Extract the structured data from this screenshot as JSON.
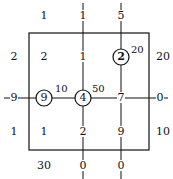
{
  "diagram": {
    "type": "transportation-grid",
    "top_row": [
      "1",
      "1",
      "5"
    ],
    "left_col": [
      "2",
      "9",
      "1"
    ],
    "right_col": [
      "20",
      "0",
      "10"
    ],
    "bottom_row": [
      "30",
      "0",
      "0"
    ],
    "cells": {
      "r1": [
        "2",
        "1",
        "2"
      ],
      "r2": [
        "9",
        "4",
        "7"
      ],
      "r3": [
        "1",
        "2",
        "9"
      ]
    },
    "circled": [
      {
        "value": "2",
        "label": "20"
      },
      {
        "value": "9",
        "label": "10"
      },
      {
        "value": "4",
        "label": "50"
      }
    ]
  }
}
